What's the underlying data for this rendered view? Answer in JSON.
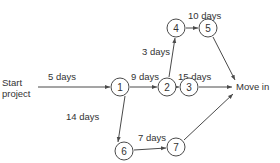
{
  "diagram": {
    "type": "project-network",
    "start_label_line1": "Start",
    "start_label_line2": "project",
    "end_label": "Move in",
    "nodes": [
      {
        "id": "1",
        "label": "1"
      },
      {
        "id": "2",
        "label": "2"
      },
      {
        "id": "3",
        "label": "3"
      },
      {
        "id": "4",
        "label": "4"
      },
      {
        "id": "5",
        "label": "5"
      },
      {
        "id": "6",
        "label": "6"
      },
      {
        "id": "7",
        "label": "7"
      }
    ],
    "edges": [
      {
        "from": "Start",
        "to": "1",
        "label": "5 days"
      },
      {
        "from": "1",
        "to": "2",
        "label": "9 days"
      },
      {
        "from": "1",
        "to": "6",
        "label": "14 days"
      },
      {
        "from": "2",
        "to": "4",
        "label": "3 days"
      },
      {
        "from": "2",
        "to": "3",
        "label": "15 days"
      },
      {
        "from": "4",
        "to": "5",
        "label": "10 days"
      },
      {
        "from": "6",
        "to": "7",
        "label": "7 days"
      },
      {
        "from": "5",
        "to": "Move in",
        "label": ""
      },
      {
        "from": "3",
        "to": "Move in",
        "label": ""
      },
      {
        "from": "7",
        "to": "Move in",
        "label": ""
      }
    ],
    "colors": {
      "stroke": "#4a4a4a",
      "text": "#333333",
      "background": "#ffffff"
    }
  }
}
